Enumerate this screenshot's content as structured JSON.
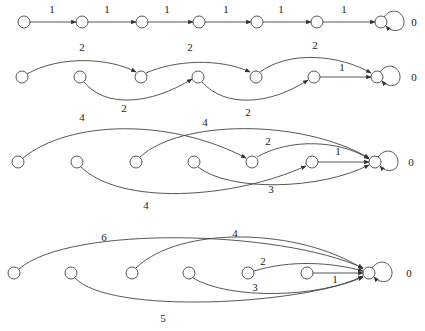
{
  "diagram": {
    "type": "directed-graph-rows",
    "node_radius": 6,
    "rows": [
      {
        "id": "row1",
        "y": 22,
        "nodes_x": [
          24,
          82,
          142,
          199,
          257,
          317,
          381
        ],
        "terminal_label": "0",
        "terminal_label_pos": [
          414,
          26
        ],
        "edges": [
          {
            "from": 0,
            "to": 1,
            "label": "1",
            "path": "M30,22 L76,22",
            "label_pos": [
              52,
              13
            ]
          },
          {
            "from": 1,
            "to": 2,
            "label": "1",
            "path": "M88,22 L136,22",
            "label_pos": [
              107,
              13
            ]
          },
          {
            "from": 2,
            "to": 3,
            "label": "1",
            "path": "M148,22 L193,22",
            "label_pos": [
              167,
              13
            ]
          },
          {
            "from": 3,
            "to": 4,
            "label": "1",
            "path": "M205,22 L251,22",
            "label_pos": [
              226,
              13
            ]
          },
          {
            "from": 4,
            "to": 5,
            "label": "1",
            "path": "M263,22 L311,22",
            "label_pos": [
              281,
              13
            ]
          },
          {
            "from": 5,
            "to": 6,
            "label": "1",
            "path": "M323,22 L375,22",
            "label_pos": [
              344,
              13
            ]
          }
        ],
        "self_loop": {
          "path": "M384,17 C392,6 404,12 404,22 C404,32 392,33 386,26"
        }
      },
      {
        "id": "row2",
        "y": 77,
        "nodes_x": [
          22,
          80,
          141,
          198,
          256,
          314,
          377
        ],
        "terminal_label": "0",
        "terminal_label_pos": [
          414,
          81
        ],
        "edges": [
          {
            "from": 0,
            "to": 2,
            "label": "2",
            "path": "M27,74 C60,55 110,58 136,72",
            "label_pos": [
              82,
              51
            ]
          },
          {
            "from": 1,
            "to": 3,
            "label": "2",
            "path": "M84,82 C105,108 150,105 192,79",
            "label_pos": [
              124,
              112
            ]
          },
          {
            "from": 2,
            "to": 4,
            "label": "2",
            "path": "M146,73 C175,60 220,58 250,72",
            "label_pos": [
              190,
              51
            ]
          },
          {
            "from": 3,
            "to": 5,
            "label": "2",
            "path": "M202,82 C225,108 270,105 308,80",
            "label_pos": [
              248,
              116
            ]
          },
          {
            "from": 4,
            "to": 6,
            "label": "2",
            "path": "M260,72 C290,50 340,55 371,73",
            "label_pos": [
              315,
              49
            ]
          },
          {
            "from": 5,
            "to": 6,
            "label": "1",
            "path": "M320,77 L371,77",
            "label_pos": [
              342,
              71
            ]
          }
        ],
        "self_loop": {
          "path": "M380,72 C388,61 400,67 400,77 C400,87 388,88 382,81"
        }
      },
      {
        "id": "row3",
        "y": 162,
        "nodes_x": [
          18,
          77,
          136,
          194,
          252,
          312,
          375
        ],
        "terminal_label": "0",
        "terminal_label_pos": [
          411,
          166
        ],
        "edges": [
          {
            "from": 0,
            "to": 4,
            "label": "4",
            "path": "M23,158 C70,120 170,118 246,158",
            "label_pos": [
              82,
              121
            ]
          },
          {
            "from": 1,
            "to": 5,
            "label": "4",
            "path": "M81,167 C120,205 230,200 306,166",
            "label_pos": [
              146,
              209
            ]
          },
          {
            "from": 2,
            "to": 6,
            "label": "4",
            "path": "M140,157 C180,120 300,118 369,158",
            "label_pos": [
              205,
              126
            ]
          },
          {
            "from": 3,
            "to": 6,
            "label": "3",
            "path": "M198,167 C230,192 320,190 369,165",
            "label_pos": [
              271,
              193
            ]
          },
          {
            "from": 4,
            "to": 6,
            "label": "2",
            "path": "M257,157 C290,138 340,140 369,159",
            "label_pos": [
              268,
              145
            ]
          },
          {
            "from": 5,
            "to": 6,
            "label": "1",
            "path": "M318,162 L369,162",
            "label_pos": [
              338,
              155
            ]
          }
        ],
        "self_loop": {
          "path": "M378,157 C386,146 398,152 398,162 C398,172 386,173 380,166"
        }
      },
      {
        "id": "row4",
        "y": 273,
        "nodes_x": [
          14,
          71,
          132,
          189,
          248,
          307,
          369
        ],
        "terminal_label": "0",
        "terminal_label_pos": [
          409,
          277
        ],
        "edges": [
          {
            "from": 0,
            "to": 6,
            "label": "6",
            "path": "M19,269 C70,225 280,230 363,268",
            "label_pos": [
              104,
              241
            ]
          },
          {
            "from": 1,
            "to": 6,
            "label": "5",
            "path": "M75,278 C110,315 300,305 363,277",
            "label_pos": [
              163,
              322
            ]
          },
          {
            "from": 2,
            "to": 6,
            "label": "4",
            "path": "M136,268 C180,225 300,228 363,269",
            "label_pos": [
              235,
              237
            ]
          },
          {
            "from": 3,
            "to": 6,
            "label": "3",
            "path": "M193,278 C230,300 320,298 363,276",
            "label_pos": [
              255,
              291
            ]
          },
          {
            "from": 4,
            "to": 6,
            "label": "2",
            "path": "M254,271 C290,260 330,262 363,271",
            "label_pos": [
              263,
              265
            ]
          },
          {
            "from": 5,
            "to": 6,
            "label": "1",
            "path": "M313,273 L363,273",
            "label_pos": [
              335,
              283
            ]
          }
        ],
        "self_loop": {
          "path": "M372,268 C380,257 392,263 392,273 C392,283 380,284 374,277"
        }
      }
    ]
  }
}
